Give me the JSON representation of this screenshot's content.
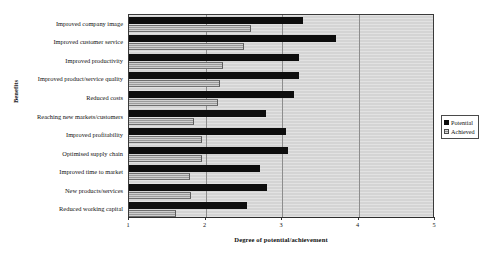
{
  "chart_data": {
    "type": "bar",
    "orientation": "horizontal",
    "title": "",
    "xlabel": "Degree of potential/achievement",
    "ylabel": "Benefits",
    "xlim": [
      1,
      5
    ],
    "xticks": [
      1,
      2,
      3,
      4,
      5
    ],
    "xtick_labels": [
      "1",
      "2",
      "3",
      "4",
      "5"
    ],
    "grid": true,
    "grid_axis": "x",
    "legend_position": "right",
    "categories": [
      "Improved company image",
      "Improved customer service",
      "Improved productivity",
      "Improved product/service quality",
      "Reduced costs",
      "Reaching new markets/customers",
      "Improved profitability",
      "Optimised supply chain",
      "Improved time to market",
      "New products/services",
      "Reduced working capital"
    ],
    "series": [
      {
        "name": "Potential",
        "color": "#0d0d0d",
        "values": [
          3.27,
          3.71,
          3.22,
          3.22,
          3.16,
          2.79,
          3.05,
          3.08,
          2.71,
          2.8,
          2.54
        ]
      },
      {
        "name": "Achieved",
        "color": "#b9b9b9",
        "values": [
          2.6,
          2.5,
          2.23,
          2.19,
          2.16,
          1.85,
          1.95,
          1.95,
          1.8,
          1.81,
          1.61
        ]
      }
    ]
  },
  "legend": {
    "items": [
      {
        "label": "Potential",
        "swatch": "black-square-icon"
      },
      {
        "label": "Achieved",
        "swatch": "hatched-square-icon"
      }
    ]
  }
}
